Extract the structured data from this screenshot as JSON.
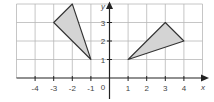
{
  "diagram": {
    "type": "coordinate-grid",
    "axes": {
      "x_label": "x",
      "y_label": "y",
      "origin_label": "0",
      "x_ticks": [
        "-4",
        "-3",
        "-2",
        "-1",
        "1",
        "2",
        "3",
        "4"
      ],
      "y_ticks": [
        "1",
        "2",
        "3"
      ]
    },
    "grid": {
      "x_range": [
        -5,
        5
      ],
      "y_range": [
        0,
        4
      ],
      "line_color": "#b0b0b0",
      "axis_color": "#222222"
    },
    "shapes": [
      {
        "name": "triangle-left",
        "vertices": [
          [
            -3,
            3
          ],
          [
            -2,
            4
          ],
          [
            -1,
            1
          ]
        ],
        "fill": "#d4d4d4",
        "stroke": "#333333"
      },
      {
        "name": "triangle-right",
        "vertices": [
          [
            1,
            1
          ],
          [
            3,
            3
          ],
          [
            4,
            2
          ]
        ],
        "fill": "#d4d4d4",
        "stroke": "#333333"
      }
    ]
  }
}
